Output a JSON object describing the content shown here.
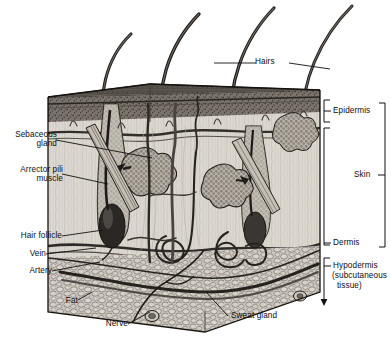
{
  "figure": {
    "type": "anatomical-cross-section",
    "style": "grayscale pen-and-ink illustration",
    "width": 391,
    "height": 341,
    "background": "#ffffff",
    "ink": "#111111"
  },
  "labels": {
    "hairs": "Hairs",
    "sebaceous_gland": "Sebaceous\ngland",
    "arrector_pili": "Arrector pili\nmuscle",
    "hair_follicle": "Hair follicle",
    "vein": "Vein",
    "artery": "Artery",
    "fat": "Fat",
    "nerve": "Nerve",
    "sweat_gland": "Sweat gland"
  },
  "brackets": {
    "epidermis": "Epidermis",
    "dermis": "Dermis",
    "skin": "Skin",
    "hypodermis_line1": "Hypodermis",
    "hypodermis_line2": "(subcutaneous",
    "hypodermis_line3": "tissue)"
  },
  "layers": [
    {
      "name": "Epidermis",
      "top": 90,
      "bottom": 122,
      "fill": "#6f6a63",
      "texture": "dense stipple, wavy dermal papillae at base"
    },
    {
      "name": "Dermis",
      "top": 122,
      "bottom": 255,
      "fill": "#d9d5cd",
      "texture": "vertical collagen striations, vessels, glands"
    },
    {
      "name": "Hypodermis",
      "top": 255,
      "bottom": 312,
      "fill": "#c9c4bb",
      "texture": "lobular adipose cells"
    }
  ],
  "hairs_count": 4,
  "colors": {
    "ink": "#111111",
    "epidermis": "#6f6a63",
    "dermis": "#d9d5cd",
    "hypodermis": "#c9c4bb",
    "surface": "#55504a",
    "vessel_dark": "#2e2b28",
    "gland": "#9a948b"
  }
}
